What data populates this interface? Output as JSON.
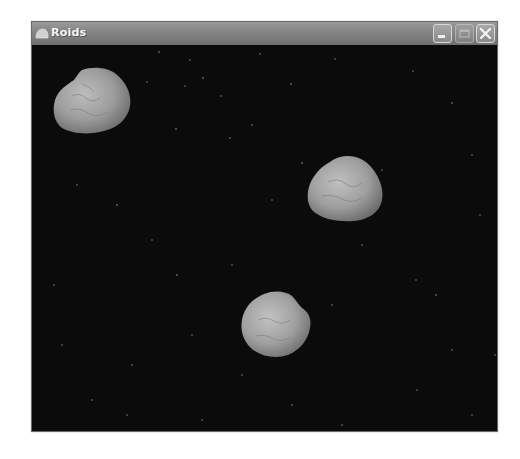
{
  "window": {
    "title": "Roids",
    "buttons": {
      "minimize": "minimize",
      "maximize": "maximize",
      "close": "close"
    }
  },
  "game": {
    "background_color": "#0b0b0b",
    "asteroids": [
      {
        "name": "asteroid-1",
        "x": 52,
        "y": 66,
        "w": 80,
        "h": 68
      },
      {
        "name": "asteroid-2",
        "x": 306,
        "y": 154,
        "w": 78,
        "h": 67
      },
      {
        "name": "asteroid-3",
        "x": 240,
        "y": 290,
        "w": 71,
        "h": 68
      }
    ]
  }
}
